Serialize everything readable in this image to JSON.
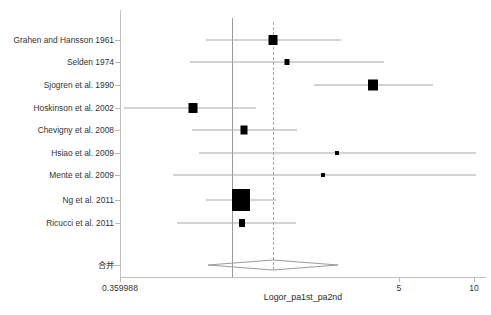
{
  "chart_data": {
    "type": "forest",
    "title": "",
    "xlabel": "Logor_pa1st_pa2nd",
    "ylabel": "",
    "xscale": "log",
    "xticks": [
      {
        "label": "0.359988",
        "px": 120
      },
      {
        "label": "5",
        "px": 399
      },
      {
        "label": "10",
        "px": 474
      }
    ],
    "xlim_px": [
      120,
      486
    ],
    "reference_lines": [
      {
        "name": "null-line",
        "style": "solid",
        "px": 232
      },
      {
        "name": "pooled-line",
        "style": "dashed",
        "px": 273
      }
    ],
    "pooled": {
      "label": "合并",
      "px": 273,
      "ci_lo_px": 208,
      "ci_hi_px": 338,
      "row_y": 265
    },
    "studies": [
      {
        "label": "Grahen and Hansson 1961",
        "row_y": 40,
        "est_px": 273,
        "ci_lo_px": 206,
        "ci_hi_px": 341,
        "box_w": 9,
        "box_h": 10
      },
      {
        "label": "Selden 1974",
        "row_y": 62,
        "est_px": 287,
        "ci_lo_px": 190,
        "ci_hi_px": 384,
        "box_w": 5,
        "box_h": 6
      },
      {
        "label": "Sjogren et al. 1990",
        "row_y": 85,
        "est_px": 373,
        "ci_lo_px": 314,
        "ci_hi_px": 433,
        "box_w": 10,
        "box_h": 11
      },
      {
        "label": "Hoskinson et al. 2002",
        "row_y": 108,
        "est_px": 193,
        "ci_lo_px": 124,
        "ci_hi_px": 256,
        "box_w": 9,
        "box_h": 10
      },
      {
        "label": "Chevigny et al. 2008",
        "row_y": 130,
        "est_px": 244,
        "ci_lo_px": 192,
        "ci_hi_px": 297,
        "box_w": 7,
        "box_h": 9
      },
      {
        "label": "Hsiao et al. 2009",
        "row_y": 153,
        "est_px": 337,
        "ci_lo_px": 199,
        "ci_hi_px": 476,
        "box_w": 4,
        "box_h": 4
      },
      {
        "label": "Mente et al. 2009",
        "row_y": 175,
        "est_px": 323,
        "ci_lo_px": 173,
        "ci_hi_px": 476,
        "box_w": 4,
        "box_h": 4
      },
      {
        "label": "Ng et al. 2011",
        "row_y": 200,
        "est_px": 241,
        "ci_lo_px": 206,
        "ci_hi_px": 276,
        "box_w": 18,
        "box_h": 22
      },
      {
        "label": "Ricucci et al. 2011",
        "row_y": 223,
        "est_px": 242,
        "ci_lo_px": 177,
        "ci_hi_px": 296,
        "box_w": 6,
        "box_h": 8
      }
    ]
  }
}
